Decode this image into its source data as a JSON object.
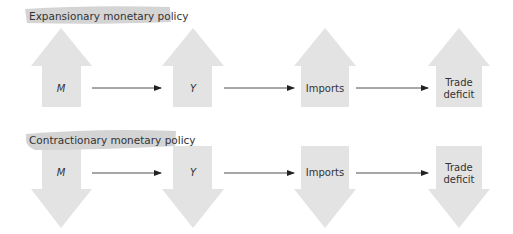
{
  "colors": {
    "arrow_fill": "#e3e3e3",
    "banner_fill": "#d4d4d4",
    "line": "#222222",
    "text": "#333333"
  },
  "sections": [
    {
      "title": "Expansionary monetary policy",
      "direction": "up",
      "nodes": [
        {
          "label": "M",
          "italic": true
        },
        {
          "label": "Y",
          "italic": true
        },
        {
          "label": "Imports",
          "italic": false
        },
        {
          "label_lines": [
            "Trade",
            "deficit"
          ],
          "italic": false
        }
      ]
    },
    {
      "title": "Contractionary monetary policy",
      "direction": "down",
      "nodes": [
        {
          "label": "M",
          "italic": true
        },
        {
          "label": "Y",
          "italic": true
        },
        {
          "label": "Imports",
          "italic": false
        },
        {
          "label_lines": [
            "Trade",
            "deficit"
          ],
          "italic": false
        }
      ]
    }
  ]
}
